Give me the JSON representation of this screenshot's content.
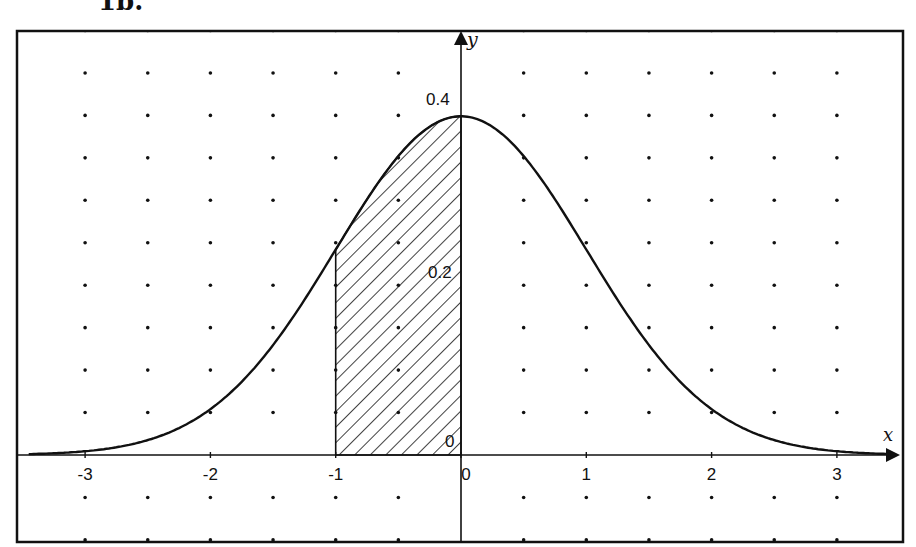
{
  "caption": "1b.",
  "chart_data": {
    "type": "line",
    "function": "y = (1/sqrt(2*pi)) * exp(-x^2/2)",
    "xlabel": "x",
    "ylabel": "y",
    "xlim": [
      -3.5,
      3.5
    ],
    "ylim": [
      -0.105,
      0.5
    ],
    "x_ticks": [
      -3,
      -2,
      -1,
      0,
      1,
      2,
      3
    ],
    "x_tick_labels": [
      "-3",
      "-2",
      "-1",
      "0",
      "1",
      "2",
      "3"
    ],
    "y_tick_labels": [
      {
        "value": 0.4,
        "label": "0.4"
      },
      {
        "value": 0.2,
        "label": "0.2"
      },
      {
        "value": 0,
        "label": "0"
      }
    ],
    "grid": "dots",
    "shaded_region": {
      "from": -1,
      "to": 0,
      "pattern": "diagonal-hatch",
      "area": 0.3413
    },
    "series": [
      {
        "name": "normal-pdf",
        "x": [
          -3.5,
          -3,
          -2.5,
          -2,
          -1.5,
          -1,
          -0.5,
          0,
          0.5,
          1,
          1.5,
          2,
          2.5,
          3,
          3.5
        ],
        "values": [
          0.0009,
          0.0044,
          0.0175,
          0.054,
          0.1295,
          0.242,
          0.3521,
          0.3989,
          0.3521,
          0.242,
          0.1295,
          0.054,
          0.0175,
          0.0044,
          0.0009
        ]
      }
    ],
    "legend": null
  },
  "labels": {
    "x_axis": "x",
    "y_axis": "y",
    "y_04": "0.4",
    "y_02": "0.2",
    "y_0": "0",
    "x_ticks": [
      "-3",
      "-2",
      "-1",
      "0",
      "1",
      "2",
      "3"
    ]
  }
}
